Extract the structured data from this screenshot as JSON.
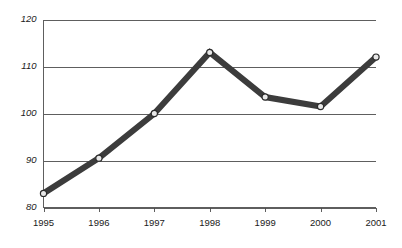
{
  "chart_data": {
    "type": "line",
    "title": "",
    "subtitle": "",
    "xlabel": "",
    "ylabel": "",
    "categories": [
      "1995",
      "1996",
      "1997",
      "1998",
      "1999",
      "2000",
      "2001"
    ],
    "x": [
      1995,
      1996,
      1997,
      1998,
      1999,
      2000,
      2001
    ],
    "values": [
      83,
      90.5,
      100,
      113,
      103.5,
      101.5,
      112
    ],
    "series": [
      {
        "name": "",
        "values": [
          83,
          90.5,
          100,
          113,
          103.5,
          101.5,
          112
        ]
      }
    ],
    "ylim": [
      80,
      120
    ],
    "xlim": [
      1995,
      2001
    ],
    "yticks": [
      80,
      90,
      100,
      110,
      120
    ],
    "ytick_labels": [
      "80",
      "90",
      "100",
      "110",
      "120"
    ],
    "xtick_labels": [
      "1995",
      "1996",
      "1997",
      "1998",
      "1999",
      "2000",
      "2001"
    ],
    "grid": "horizontal",
    "legend": "none",
    "annotations": [],
    "style": {
      "line_color": "#3c3c3c",
      "line_width": 6,
      "marker": "circle",
      "marker_face_color": "#e8e8e8",
      "marker_edge_color": "#2b2b2b",
      "marker_size": 3.1,
      "grid_color": "#4d4d4d",
      "axis_color": "#4d4d4d",
      "background": "#ffffff",
      "tick_label_color": "#1a1a1a"
    }
  }
}
